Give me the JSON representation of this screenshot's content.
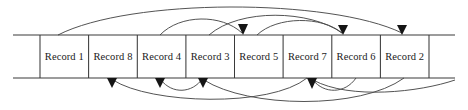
{
  "figure": {
    "colors": {
      "line": "#3a3a3a",
      "arc": "#4a4a4a",
      "arrow": "#151515",
      "text": "#1a1a1a",
      "background": "#ffffff"
    }
  },
  "tape": {
    "left_edge_x": 13,
    "right_edge_x": 455,
    "top_y": 35,
    "bottom_y": 78,
    "first_divider_x": 40,
    "last_divider_x": 430,
    "cell_width": 48.6,
    "cells": [
      {
        "label": "Record 1",
        "index": 0,
        "x0": 40,
        "x1": 88.6,
        "center": 64.3
      },
      {
        "label": "Record 8",
        "index": 1,
        "x0": 88.6,
        "x1": 137.3,
        "center": 113.0
      },
      {
        "label": "Record 4",
        "index": 2,
        "x0": 137.3,
        "x1": 185.9,
        "center": 161.6
      },
      {
        "label": "Record 3",
        "index": 3,
        "x0": 185.9,
        "x1": 234.5,
        "center": 210.2
      },
      {
        "label": "Record 5",
        "index": 4,
        "x0": 234.5,
        "x1": 283.1,
        "center": 258.8
      },
      {
        "label": "Record 7",
        "index": 5,
        "x0": 283.1,
        "x1": 331.8,
        "center": 307.4
      },
      {
        "label": "Record 6",
        "index": 6,
        "x0": 331.8,
        "x1": 380.4,
        "center": 356.1
      },
      {
        "label": "Record 2",
        "index": 7,
        "x0": 380.4,
        "x1": 429.0,
        "center": 404.7
      }
    ]
  },
  "arcs_above": [
    {
      "name": "arc-r1-to-r2-slot",
      "from_x": 58,
      "to_x": 402,
      "peak_y": 8,
      "arrow": true
    },
    {
      "name": "arc-r4-to-r5-slot",
      "from_x": 160,
      "to_x": 243,
      "peak_y": 22,
      "arrow": true
    },
    {
      "name": "arc-r5-to-r6-slot",
      "from_x": 257,
      "to_x": 343,
      "peak_y": 24,
      "arrow": true
    },
    {
      "name": "arc-r3-to-r6-long",
      "from_x": 209,
      "to_x": 343,
      "peak_y": 13,
      "arrow": false
    }
  ],
  "arcs_below": [
    {
      "name": "arc-to-r8-slot",
      "from_x": 307,
      "to_x": 112,
      "dip_y": 104,
      "arrow": true
    },
    {
      "name": "arc-to-r4-slot",
      "from_x": 203,
      "to_x": 160,
      "dip_y": 90,
      "arrow": true
    },
    {
      "name": "arc-to-r3-slot",
      "from_x": 404,
      "to_x": 203,
      "dip_y": 104,
      "arrow": true
    },
    {
      "name": "arc-to-r7-slot",
      "from_x": 356,
      "to_x": 312,
      "dip_y": 90,
      "arrow": true
    },
    {
      "name": "arc-long-right-tail",
      "from_x": 452,
      "to_x": 312,
      "dip_y": 100,
      "arrow": false
    }
  ],
  "arrowheads_above": [
    {
      "name": "arrowhead-slot-5",
      "x": 243
    },
    {
      "name": "arrowhead-slot-7",
      "x": 343
    },
    {
      "name": "arrowhead-slot-8",
      "x": 402
    }
  ],
  "arrowheads_below": [
    {
      "name": "arrowhead-slot-2",
      "x": 112
    },
    {
      "name": "arrowhead-slot-3",
      "x": 160
    },
    {
      "name": "arrowhead-slot-4",
      "x": 203
    },
    {
      "name": "arrowhead-slot-6",
      "x": 312
    }
  ]
}
